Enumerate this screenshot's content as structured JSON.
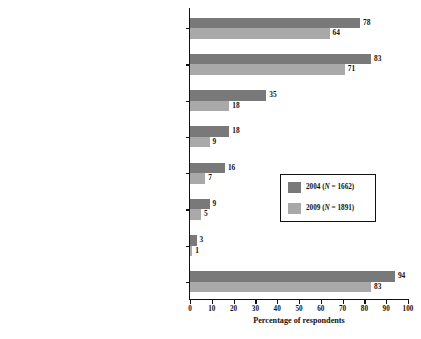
{
  "chart_data": {
    "type": "bar",
    "orientation": "horizontal",
    "title": "",
    "xlabel": "Percentage of respondents",
    "ylabel": "",
    "xlim": [
      0,
      100
    ],
    "xticks": [
      0,
      10,
      20,
      30,
      40,
      50,
      60,
      70,
      80,
      90,
      100
    ],
    "grid": false,
    "legend_position": "middle-right",
    "categories": [
      "Free drug samples",
      "Gifts (e.g., food, beverages, and entertainment)",
      "Reimbursements (e.g., travel, food, lodging,\nand continuing education)",
      "Payments for consulting",
      "Payments for serving as a speaker",
      "Payments for serving on an advisory board",
      "Payments for enrolling patients in clinical trials",
      "Any of the above relationships"
    ],
    "series": [
      {
        "name": "2004",
        "legend_label_prefix": "2004 (",
        "legend_label_italic": "N",
        "legend_label_suffix": " = 1662)",
        "color": "#797979",
        "values": [
          78,
          83,
          35,
          18,
          16,
          9,
          3,
          94
        ]
      },
      {
        "name": "2009",
        "legend_label_prefix": "2009 (",
        "legend_label_italic": "N",
        "legend_label_suffix": " = 1891)",
        "color": "#a9a9a9",
        "values": [
          64,
          71,
          18,
          9,
          7,
          5,
          1,
          83
        ]
      }
    ]
  },
  "axis": {
    "tick_labels": [
      "0",
      "10",
      "20",
      "30",
      "40",
      "50",
      "60",
      "70",
      "80",
      "90",
      "100"
    ],
    "x_title": "Percentage of respondents"
  },
  "colors": {
    "series_2004": "#797979",
    "series_2009": "#a9a9a9",
    "axis": "#111111",
    "background": "#ffffff"
  }
}
